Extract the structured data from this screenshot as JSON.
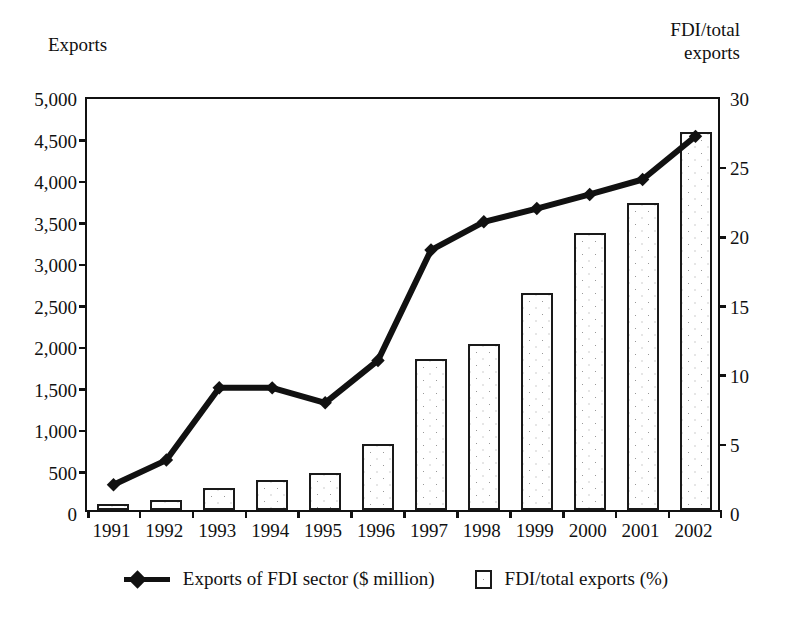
{
  "axis_captions": {
    "left": "Exports",
    "right": "FDI/total\nexports"
  },
  "legend": [
    {
      "label": "Exports of FDI sector ($ million)",
      "marker": "line-diamond-marker"
    },
    {
      "label": "FDI/total exports (%)",
      "marker": "stippled-square-swatch"
    }
  ],
  "chart_data": {
    "type": "bar",
    "title": "",
    "xlabel": "",
    "grid": false,
    "legend_position": "bottom",
    "categories": [
      "1991",
      "1992",
      "1993",
      "1994",
      "1995",
      "1996",
      "1997",
      "1998",
      "1999",
      "2000",
      "2001",
      "2002"
    ],
    "series": [
      {
        "name": "Exports of FDI sector ($ million)",
        "type": "line",
        "axis": "left",
        "marker": "diamond",
        "color": "#111111",
        "values": [
          352,
          650,
          1520,
          1520,
          1340,
          1850,
          3180,
          3520,
          3680,
          3850,
          4030,
          4550
        ]
      },
      {
        "name": "FDI/total exports (%)",
        "type": "bar",
        "axis": "right",
        "color": "#ffffff",
        "values": [
          0.4,
          0.7,
          1.6,
          2.2,
          2.7,
          4.8,
          10.9,
          12.0,
          15.7,
          20.0,
          22.2,
          27.3
        ]
      }
    ],
    "left_axis": {
      "label": "Exports",
      "ylim": [
        0,
        5000
      ],
      "tick_step": 500,
      "ticks": [
        "0",
        "500",
        "1,000",
        "1,500",
        "2,000",
        "2,500",
        "3,000",
        "3,500",
        "4,000",
        "4,500",
        "5,000"
      ]
    },
    "right_axis": {
      "label": "FDI/total exports",
      "ylim": [
        0,
        30
      ],
      "tick_step": 5,
      "ticks": [
        "0",
        "5",
        "10",
        "15",
        "20",
        "25",
        "30"
      ]
    }
  }
}
